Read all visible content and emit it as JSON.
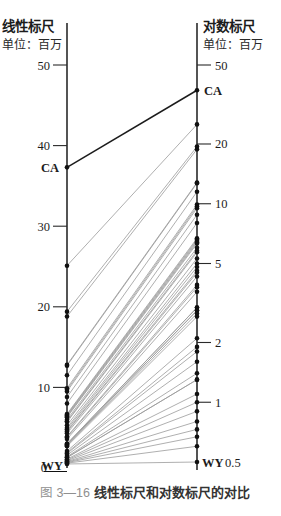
{
  "figure": {
    "caption_label": "图 3—16",
    "caption_title": "线性标尺和对数标尺的对比"
  },
  "chart_data": {
    "type": "line",
    "subtype": "slopegraph",
    "title": "线性标尺和对数标尺的对比",
    "left_axis": {
      "title": "线性标尺",
      "unit": "单位：百万",
      "scale": "linear",
      "ticks": [
        50,
        40,
        30,
        20,
        10
      ],
      "origin_label": "0",
      "range": [
        0,
        55
      ]
    },
    "right_axis": {
      "title": "对数标尺",
      "unit": "单位：百万",
      "scale": "log",
      "ticks": [
        50,
        20,
        10,
        5,
        2,
        1
      ],
      "min_tick_label": "0.5",
      "range": [
        0.5,
        55
      ]
    },
    "values": [
      37.3,
      25.1,
      19.4,
      18.8,
      12.8,
      12.7,
      11.5,
      9.9,
      9.7,
      9.5,
      8.8,
      8.0,
      6.7,
      6.6,
      6.5,
      6.4,
      6.3,
      6.0,
      5.8,
      5.7,
      5.3,
      5.0,
      4.8,
      4.6,
      4.5,
      4.3,
      3.9,
      3.8,
      3.6,
      3.0,
      3.0,
      2.9,
      2.9,
      2.8,
      2.7,
      2.1,
      1.9,
      1.8,
      1.6,
      1.4,
      1.3,
      1.3,
      1.1,
      1.0,
      0.9,
      0.8,
      0.73,
      0.67,
      0.6,
      0.5
    ],
    "labeled_points": [
      {
        "label": "CA",
        "value": 37.3
      },
      {
        "label": "WY",
        "value": 0.5
      }
    ],
    "colors": {
      "line": "#9b9b9b",
      "highlight": "#1c1c1c",
      "axis": "#2a2a2a",
      "dot": "#111111"
    }
  },
  "labels": {
    "ca": "CA",
    "wy": "WY",
    "wy_value": "0.5",
    "zero": "0"
  }
}
